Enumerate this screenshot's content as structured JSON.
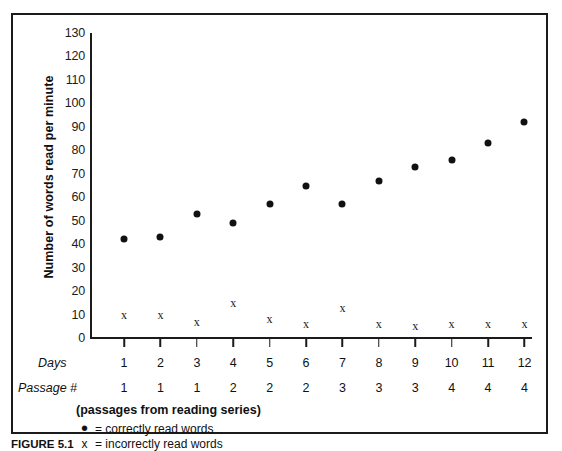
{
  "chart_data": {
    "type": "scatter",
    "title": "",
    "xlabel": "Days",
    "ylabel": "Number of words read per minute",
    "ylim": [
      0,
      130
    ],
    "ytick_step": 10,
    "yticks": [
      130,
      120,
      110,
      100,
      90,
      80,
      70,
      60,
      50,
      40,
      30,
      20,
      10,
      0
    ],
    "grid": false,
    "legend_position": "below-axis-left",
    "categories": [
      "1",
      "2",
      "3",
      "4",
      "5",
      "6",
      "7",
      "8",
      "9",
      "10",
      "11",
      "12"
    ],
    "secondary_categories": [
      "1",
      "1",
      "1",
      "2",
      "2",
      "2",
      "3",
      "3",
      "3",
      "4",
      "4",
      "4"
    ],
    "secondary_label": "Passage #",
    "series": [
      {
        "name": "correctly read words",
        "marker": "dot",
        "values": [
          42,
          43,
          53,
          49,
          57,
          65,
          57,
          67,
          73,
          76,
          83,
          92
        ]
      },
      {
        "name": "incorrectly read words",
        "marker": "x",
        "values": [
          10,
          10,
          7,
          15,
          8,
          6,
          13,
          6,
          5,
          6,
          6,
          6
        ]
      }
    ],
    "annotations": [
      "(passages from reading series)"
    ]
  },
  "axes": {
    "y_title": "Number of words read per minute",
    "y_tick_labels": [
      "130",
      "120",
      "110",
      "100",
      "90",
      "80",
      "70",
      "60",
      "50",
      "40",
      "30",
      "20",
      "10",
      "0"
    ],
    "x_row_labels": {
      "days": "Days",
      "passage": "Passage #"
    },
    "days_values": [
      "1",
      "2",
      "3",
      "4",
      "5",
      "6",
      "7",
      "8",
      "9",
      "10",
      "11",
      "12"
    ],
    "passage_values": [
      "1",
      "1",
      "1",
      "2",
      "2",
      "2",
      "3",
      "3",
      "3",
      "4",
      "4",
      "4"
    ]
  },
  "notes": {
    "passages_note": "(passages from reading series)"
  },
  "legend": {
    "items": [
      {
        "symbol": "•",
        "text": "= correctly read words"
      },
      {
        "symbol": "x",
        "text": "= incorrectly read words"
      }
    ]
  },
  "caption": {
    "figure_number": "FIGURE 5.1",
    "text": ""
  },
  "colors": {
    "ink": "#1b1b1b",
    "marker": "#111111",
    "background": "#ffffff"
  }
}
